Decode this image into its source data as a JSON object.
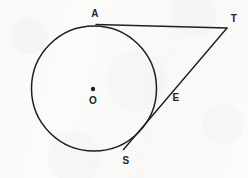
{
  "figure": {
    "canvas": {
      "width": 248,
      "height": 178
    },
    "background_color": "#fbfbfa",
    "stroke_color": "#1f1f1f",
    "label_color": "#242424",
    "circle": {
      "name": "main-circle",
      "center": {
        "x": 94,
        "y": 88.5
      },
      "radius": 62.5,
      "stroke_width": 1.5
    },
    "center_dot": {
      "name": "center-point-o",
      "x": 93,
      "y": 89,
      "radius": 2.2
    },
    "points": [
      {
        "id": "A",
        "label": "A",
        "x": 97,
        "y": 25,
        "label_x": 95,
        "label_y": 14
      },
      {
        "id": "T",
        "label": "T",
        "x": 227,
        "y": 28,
        "label_x": 234,
        "label_y": 19
      },
      {
        "id": "E",
        "label": "E",
        "x": 157,
        "y": 100,
        "label_x": 176,
        "label_y": 98
      },
      {
        "id": "S",
        "label": "S",
        "x": 124,
        "y": 149,
        "label_x": 126,
        "label_y": 161
      },
      {
        "id": "O",
        "label": "O",
        "x": 93,
        "y": 89,
        "label_x": 93,
        "label_y": 101
      }
    ],
    "segments": [
      {
        "id": "tangent-AT",
        "from": "A",
        "to": "T",
        "x1": 96,
        "y1": 24.5,
        "x2": 227,
        "y2": 28,
        "stroke_width": 1.4
      },
      {
        "id": "secant-ST",
        "from": "S",
        "to": "T",
        "x1": 123.5,
        "y1": 149.5,
        "x2": 227,
        "y2": 28,
        "stroke_width": 1.4
      }
    ]
  },
  "chart_data": {
    "type": "diagram",
    "shapes": [
      {
        "kind": "circle",
        "label": "O",
        "cx": 94,
        "cy": 88.5,
        "r": 62.5
      },
      {
        "kind": "point",
        "label": "O",
        "x": 93,
        "y": 89
      },
      {
        "kind": "point",
        "label": "A",
        "x": 97,
        "y": 25
      },
      {
        "kind": "point",
        "label": "T",
        "x": 227,
        "y": 28
      },
      {
        "kind": "point",
        "label": "E",
        "x": 157,
        "y": 100
      },
      {
        "kind": "point",
        "label": "S",
        "x": 124,
        "y": 149
      },
      {
        "kind": "line",
        "label": "TA",
        "from": [
          96,
          24.5
        ],
        "to": [
          227,
          28
        ]
      },
      {
        "kind": "line",
        "label": "TS",
        "from": [
          123.5,
          149.5
        ],
        "to": [
          227,
          28
        ]
      }
    ],
    "labels": [
      "A",
      "T",
      "E",
      "S",
      "O"
    ]
  }
}
